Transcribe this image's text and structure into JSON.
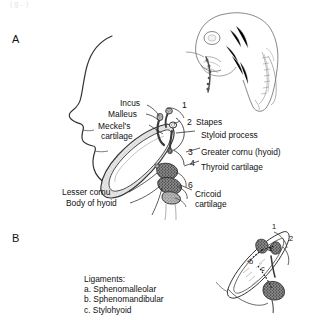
{
  "figure": {
    "top_fragment": "( g .. )",
    "panels": [
      {
        "letter": "A",
        "name": "pharyngeal-arch-derivatives-lateral"
      },
      {
        "letter": "B",
        "name": "ligaments-detail"
      }
    ]
  },
  "panel_a": {
    "labels": [
      {
        "id": "incus",
        "text": "Incus"
      },
      {
        "id": "malleus",
        "text": "Malleus"
      },
      {
        "id": "meckels-cartilage-line1",
        "text": "Meckel's"
      },
      {
        "id": "meckels-cartilage-line2",
        "text": "cartilage"
      },
      {
        "id": "stapes",
        "text": "Stapes"
      },
      {
        "id": "styloid-process",
        "text": "Styloid process"
      },
      {
        "id": "greater-cornu",
        "text": "Greater cornu (hyoid)"
      },
      {
        "id": "thyroid-cartilage",
        "text": "Thyroid cartilage"
      },
      {
        "id": "lesser-cornu",
        "text": "Lesser cornu"
      },
      {
        "id": "body-of-hyoid",
        "text": "Body of hyoid"
      },
      {
        "id": "cricoid-line1",
        "text": "Cricoid"
      },
      {
        "id": "cricoid-line2",
        "text": "cartilage"
      }
    ],
    "arch_numbers": [
      "1",
      "2",
      "3",
      "4",
      "6"
    ]
  },
  "panel_b": {
    "arch_numbers": [
      "1",
      "2"
    ],
    "ligament_marks": [
      "a",
      "b",
      "c"
    ],
    "legend_title": "Ligaments:",
    "legend_items": [
      "a. Sphenomalleolar",
      "b. Sphenomandibular",
      "c. Stylohyoid"
    ]
  },
  "colors": {
    "ink": "#1a1a1a",
    "line": "#2b2b2b",
    "cartilage_light": "#d5d5d5",
    "cartilage_mid": "#a8a8a8",
    "cartilage_dark": "#6e6e6e",
    "background": "#ffffff"
  }
}
